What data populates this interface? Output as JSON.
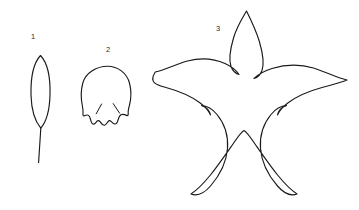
{
  "figure": {
    "background_color": "#ffffff",
    "stroke_color": "#1a1a1a",
    "label_color": "#2b2b2b",
    "items": [
      {
        "label": "1",
        "name": "lanceolate-leaf-with-stem",
        "description": "Narrow elliptic lanceolate leaf blade with a long straight petiole",
        "label_x": 33,
        "label_y": 37,
        "outline_path": "M 40.5 55.5 C 47.5 63 50.5 78 50.0 95 C 49.6 110 46.0 122 40.8 128.2 C 35.6 122 31.4 110 31.0 95 C 30.6 78 33.6 63 40.5 55.5 Z",
        "stem_path": "M 40.8 128.2 L 38.6 162.5",
        "vein_paths": []
      },
      {
        "label": "2",
        "name": "rounded-lobed-leaf",
        "description": "Rounded orbicular leaf blade with a scalloped crenate lobed base and two short basal notch lines",
        "label_x": 108,
        "label_y": 50,
        "outline_path": "M 107.6 66.2 C 117.6 66.2 127.0 72.8 129.6 83.5 C 131.6 91.5 131.0 99.5 129.4 105.5 C 128.6 108.6 128.0 110.8 128.2 112.8 C 128.4 115.0 128.0 116.0 126.6 115.4 C 124.8 114.6 122.6 114.0 121.0 114.8 C 119.4 115.6 118.6 117.8 118.0 120.2 C 117.4 122.8 116.2 124.2 114.6 124.0 C 113.0 123.8 112.0 122.4 111.0 121.4 C 110.0 120.4 109.0 120.4 108.0 121.6 C 107.0 122.8 106.2 124.8 104.6 125.2 C 103.0 125.6 101.8 124.2 100.8 122.6 C 99.8 121.0 98.8 120.2 97.6 120.8 C 96.4 121.4 95.6 123.4 94.2 124.0 C 92.8 124.6 91.6 123.4 91.0 121.2 C 90.4 119.0 90.0 116.4 88.6 115.4 C 87.2 114.4 85.6 115.2 84.4 115.8 C 83.2 116.4 82.8 115.4 83.0 113.4 C 83.2 111.4 83.0 109.0 82.4 106.0 C 81.0 99.5 80.6 91.0 82.8 83.0 C 85.6 72.6 96.8 66.2 107.6 66.2 Z",
        "vein_paths": [
          "M 101.6 104.0 L 96.2 113.8",
          "M 113.2 103.6 L 119.6 113.2"
        ]
      },
      {
        "label": "3",
        "name": "five-lobed-palmate-leaf",
        "description": "Large five-lobed palmate star-shaped leaf with deep narrow sinuses and acuminate lobe tips",
        "label_x": 218,
        "label_y": 29,
        "outline_path": "M 246.5 11.0 C 250.5 19.0 256.0 30.0 259.5 42.0 C 263.0 54.0 264.5 63.5 262.0 70.5 C 260.5 74.5 257.5 77.5 254.0 78.5 C 258.0 74.5 264.0 71.0 272.0 68.5 C 285.0 64.5 300.0 64.0 313.5 68.0 C 325.0 71.5 336.0 77.5 347.0 80.0 C 340.0 83.0 331.0 85.0 322.0 87.5 C 310.0 90.8 298.0 95.5 288.5 102.5 C 283.0 106.5 279.0 111.0 277.5 115.0 C 278.5 110.5 282.0 107.0 286.5 105.5 C 281.0 105.8 275.5 109.0 271.0 114.5 C 264.0 123.0 259.5 135.0 260.5 148.5 C 261.5 162.0 268.0 175.0 277.5 186.0 C 283.0 192.4 290.0 196.5 297.0 194.0 C 291.0 190.0 284.5 183.5 278.0 175.5 C 269.5 165.0 261.0 152.5 254.0 142.5 C 249.5 136.0 246.0 131.5 244.0 130.5 C 242.0 131.5 238.5 136.0 234.0 142.5 C 227.0 152.5 218.5 165.0 210.0 175.5 C 203.5 183.5 197.0 190.0 191.0 194.0 C 198.0 196.5 205.0 192.4 210.5 186.0 C 220.0 175.0 226.5 162.0 227.5 148.5 C 228.5 135.0 224.0 123.0 217.0 114.5 C 212.5 109.0 207.0 105.8 201.5 105.5 C 206.0 107.0 209.5 110.5 210.5 115.0 C 209.0 111.0 205.0 106.5 199.5 102.5 C 190.0 95.5 178.0 90.8 166.0 87.5 C 157.0 85.0 148.5 83.0 155.0 72.5 C 155.0 72.0 155.0 72.0 155.2 72.0 C 166.0 69.5 176.5 64.0 187.5 61.0 C 200.5 57.5 214.0 58.5 225.0 63.5 C 231.5 66.5 236.5 70.5 239.0 74.5 C 235.5 73.5 232.5 70.5 231.0 66.5 C 228.5 59.5 230.0 50.0 233.5 38.0 C 237.0 26.0 242.5 18.0 246.5 11.0 Z",
        "vein_paths": []
      }
    ]
  }
}
